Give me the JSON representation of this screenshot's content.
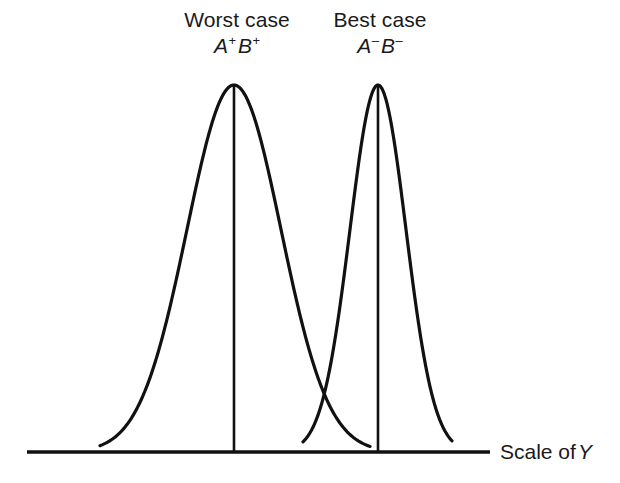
{
  "figure": {
    "background_color": "#ffffff",
    "stroke_color": "#111111",
    "text_color": "#1a1a1a"
  },
  "labels": {
    "worst": {
      "title": "Worst case",
      "factor_a": "A",
      "factor_a_sign": "+",
      "factor_b": "B",
      "factor_b_sign": "+"
    },
    "best": {
      "title": "Best case",
      "factor_a": "A",
      "factor_a_sign": "–",
      "factor_b": "B",
      "factor_b_sign": "–"
    },
    "axis": {
      "text": "Scale of",
      "variable": "Y"
    }
  },
  "chart_data": {
    "type": "line",
    "title": "",
    "xlabel": "Scale of Y",
    "ylabel": "",
    "grid": false,
    "legend": "none",
    "axis": {
      "baseline_y_px": 452,
      "x_start_px": 27,
      "x_end_px": 490,
      "tick_labels": [],
      "x_values_shown": false,
      "y_values_shown": false
    },
    "series": [
      {
        "name": "Worst case A+B+",
        "distribution": "normal",
        "mean_px": 234,
        "sigma_px": 47,
        "peak_y_px": 85,
        "peak_height_px": 367,
        "left_tail_px": 100,
        "right_tail_px": 370,
        "has_center_line": true,
        "stroke_width": 3.2
      },
      {
        "name": "Best case A-B-",
        "distribution": "normal",
        "mean_px": 378,
        "sigma_px": 28,
        "peak_y_px": 85,
        "peak_height_px": 367,
        "left_tail_px": 303,
        "right_tail_px": 452,
        "has_center_line": true,
        "stroke_width": 3.2
      }
    ],
    "annotations": [
      {
        "text": "Worst case",
        "x_px": 237,
        "y_px": 18
      },
      {
        "text": "A+B+",
        "x_px": 237,
        "y_px": 44
      },
      {
        "text": "Best case",
        "x_px": 380,
        "y_px": 18
      },
      {
        "text": "A-B-",
        "x_px": 380,
        "y_px": 44
      },
      {
        "text": "Scale of Y",
        "x_px": 500,
        "y_px": 450
      }
    ],
    "crossing_point_px": {
      "x": 330,
      "y": 405
    }
  }
}
